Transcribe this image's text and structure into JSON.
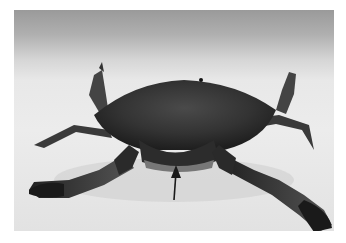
{
  "image": {
    "subject": "crab",
    "description": "Grayscale photograph of a crab on a white surface, viewed from the front, with a black arrow pointing up at the underside of the carapace",
    "annotation": {
      "type": "arrow",
      "direction": "up",
      "color": "#1a1a1a"
    },
    "colors": {
      "background": "#ffffff",
      "surface": "#e6e6e6",
      "crab_dark": "#2a2a2a",
      "crab_mid": "#5a5a5a"
    }
  }
}
